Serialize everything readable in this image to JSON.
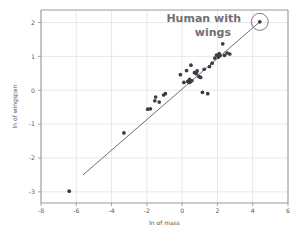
{
  "chart_data": {
    "type": "scatter",
    "title": "",
    "xlabel": "ln of mass",
    "ylabel": "ln of wingspan",
    "xlim": [
      -8,
      6
    ],
    "ylim": [
      -3.35,
      2.35
    ],
    "xticks": [
      -8,
      -6,
      -4,
      -2,
      0,
      2,
      4,
      6
    ],
    "xtick_labels": [
      "-8",
      "-6",
      "-4",
      "-2",
      "0",
      "2",
      "4",
      "6"
    ],
    "yticks": [
      -3,
      -2,
      -1,
      0,
      1,
      2
    ],
    "ytick_labels": [
      "-3",
      "-2",
      "-1",
      "0",
      "1",
      "2"
    ],
    "grid": true,
    "legend": "none",
    "series": [
      {
        "name": "flying animals",
        "marker": "circle",
        "color": "#3b3b44",
        "points": [
          [
            -6.4,
            -3.0
          ],
          [
            -3.3,
            -1.28
          ],
          [
            -1.95,
            -0.58
          ],
          [
            -1.8,
            -0.57
          ],
          [
            -1.55,
            -0.33
          ],
          [
            -1.5,
            -0.22
          ],
          [
            -1.3,
            -0.37
          ],
          [
            -1.05,
            -0.16
          ],
          [
            -0.95,
            -0.12
          ],
          [
            -0.1,
            0.44
          ],
          [
            0.1,
            0.21
          ],
          [
            0.25,
            0.56
          ],
          [
            0.32,
            0.24
          ],
          [
            0.4,
            0.21
          ],
          [
            0.42,
            0.3
          ],
          [
            0.45,
            0.22
          ],
          [
            0.5,
            0.72
          ],
          [
            0.55,
            0.26
          ],
          [
            0.7,
            0.5
          ],
          [
            0.8,
            0.47
          ],
          [
            0.85,
            0.55
          ],
          [
            0.95,
            0.38
          ],
          [
            1.05,
            0.36
          ],
          [
            1.15,
            -0.08
          ],
          [
            1.25,
            0.6
          ],
          [
            1.45,
            -0.12
          ],
          [
            1.55,
            0.68
          ],
          [
            1.7,
            0.78
          ],
          [
            1.85,
            0.93
          ],
          [
            1.95,
            1.02
          ],
          [
            2.05,
            0.96
          ],
          [
            2.1,
            1.06
          ],
          [
            2.15,
            1.0
          ],
          [
            2.3,
            1.35
          ],
          [
            2.4,
            1.01
          ],
          [
            2.55,
            1.08
          ],
          [
            2.7,
            1.05
          ],
          [
            4.4,
            2.0
          ]
        ]
      }
    ],
    "fit_line": {
      "name": "regression line",
      "x_start": -5.62,
      "y_start": -2.52,
      "x_end": 4.42,
      "y_end": 2.01,
      "color": "#54545c"
    },
    "annotations": [
      {
        "name": "human-with-wings",
        "text_line_1": "Human with",
        "text_line_2": "wings",
        "color": "#6f7076",
        "highlight_point": [
          4.4,
          2.0
        ],
        "highlight_radius_px": 8.5
      }
    ]
  }
}
